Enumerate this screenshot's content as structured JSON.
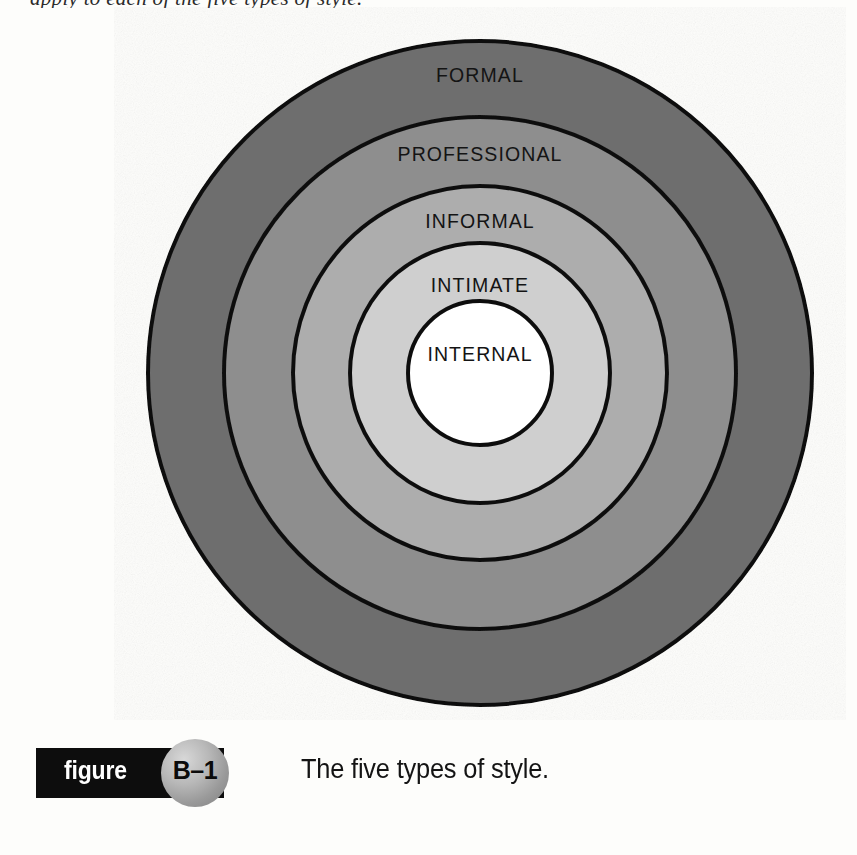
{
  "page": {
    "background_color": "#fdfdfb",
    "top_clipped_text": "apply to each of the five types of style."
  },
  "figure": {
    "label_word": "figure",
    "number": "B–1",
    "caption": "The five types of style.",
    "bar_color": "#0d0d0d",
    "bar_text_color": "#ffffff",
    "badge_fill": "#9a9a9a"
  },
  "chart_data": {
    "type": "pie",
    "title": "The five types of style.",
    "subtype": "concentric-rings",
    "center": {
      "cx": 480,
      "cy": 373
    },
    "stroke_color": "#111111",
    "stroke_width": 4,
    "rings": [
      {
        "label": "FORMAL",
        "level": 1,
        "position": "outermost",
        "radius": 332,
        "fill": "#6e6e6e",
        "label_x": 480,
        "label_y": 82
      },
      {
        "label": "PROFESSIONAL",
        "level": 2,
        "position": "second",
        "radius": 256,
        "fill": "#8e8e8e",
        "label_x": 480,
        "label_y": 161
      },
      {
        "label": "INFORMAL",
        "level": 3,
        "position": "third",
        "radius": 187,
        "fill": "#adadad",
        "label_x": 480,
        "label_y": 228
      },
      {
        "label": "INTIMATE",
        "level": 4,
        "position": "fourth",
        "radius": 130,
        "fill": "#cfcfcf",
        "label_x": 480,
        "label_y": 292
      },
      {
        "label": "INTERNAL",
        "level": 5,
        "position": "innermost",
        "radius": 72,
        "fill": "#ffffff",
        "label_x": 480,
        "label_y": 361
      }
    ],
    "legend": "none",
    "grid": false
  }
}
